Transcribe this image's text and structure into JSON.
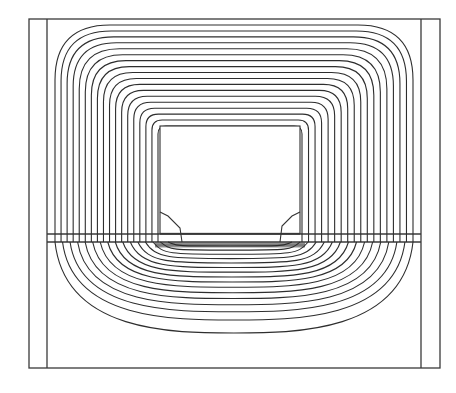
{
  "figure": {
    "title": "",
    "width": 456,
    "height": 393,
    "line_color": "#2e2e2e",
    "background": "#ffffff"
  },
  "geometry": {
    "outer_frame": {
      "x1": 29,
      "y1": 19,
      "x2": 440,
      "y2": 368
    },
    "inner_left_x": 47,
    "inner_right_x": 421,
    "band_top_y": 234,
    "band_bottom_y": 242,
    "window": {
      "x1": 160,
      "y1": 126,
      "x2": 300,
      "y2": 234
    }
  },
  "flux_lines": {
    "upper_count": 18,
    "upper_outer": {
      "x1": 55,
      "y1": 25,
      "x2": 413,
      "corner_radius": 55
    },
    "upper_inner": {
      "x1": 158,
      "y1": 126,
      "x2": 302,
      "corner_radius": 8
    },
    "lower_count": 16,
    "lower_outer_depth_y": 333,
    "lower_inner_depth_y": 246
  },
  "annotations": []
}
